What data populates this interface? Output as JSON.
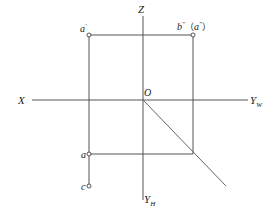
{
  "diagram": {
    "type": "orthographic-projection",
    "colors": {
      "line": "#555555",
      "text": "#222222",
      "background": "#ffffff"
    },
    "axes": {
      "x_label": "X",
      "z_label": "Z",
      "origin_label": "O",
      "yw_label": "Y",
      "yw_sub": "W",
      "yh_label": "Y",
      "yh_sub": "H"
    },
    "points": {
      "a_prime": {
        "label": "a",
        "mark": "′"
      },
      "b_double_prime": {
        "label": "b",
        "mark": "″"
      },
      "a_double_prime": {
        "label": "a",
        "mark": "″",
        "paren_open": "（",
        "paren_close": "）"
      },
      "a": {
        "label": "a"
      },
      "c": {
        "label": "c"
      }
    }
  }
}
